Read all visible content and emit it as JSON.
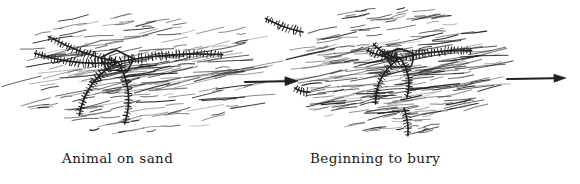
{
  "figure": {
    "medium": "pen-and-ink hand drawing",
    "background_color": "#ffffff",
    "ink_color": "#1f1f1f",
    "width": 580,
    "height": 184
  },
  "panels": [
    {
      "id": "panel-1",
      "caption": "Animal on sand",
      "caption_x": 62,
      "caption_y": 163,
      "subject": "brittle-star",
      "state": "fully exposed on sand surface",
      "center_x": 118,
      "center_y": 62,
      "disc": {
        "cx": 118,
        "cy": 62,
        "rx": 17,
        "ry": 11
      },
      "arms": [
        {
          "name": "arm-upper-left",
          "angle_deg": 186,
          "length": 84,
          "curve": -9,
          "spines": 26
        },
        {
          "name": "arm-mid-left",
          "angle_deg": 200,
          "length": 74,
          "curve": -6,
          "spines": 22
        },
        {
          "name": "arm-right",
          "angle_deg": 356,
          "length": 105,
          "curve": -7,
          "spines": 30
        },
        {
          "name": "arm-lower-left",
          "angle_deg": 126,
          "length": 66,
          "curve": 16,
          "spines": 20
        },
        {
          "name": "arm-lower-right",
          "angle_deg": 84,
          "length": 62,
          "curve": -14,
          "spines": 19
        }
      ],
      "sand_patch": {
        "x": 18,
        "y": 8,
        "w": 250,
        "h": 126,
        "stroke_count": 170
      }
    },
    {
      "id": "panel-2",
      "caption": "Beginning to bury",
      "caption_x": 310,
      "caption_y": 163,
      "subject": "brittle-star",
      "state": "partially covered by sand, arms fragmented",
      "center_x": 400,
      "center_y": 58,
      "disc": {
        "cx": 400,
        "cy": 58,
        "rx": 16,
        "ry": 10
      },
      "arms": [
        {
          "name": "arm-upper-left-fragment",
          "angle_deg": 208,
          "length": 30,
          "curve": -6,
          "spines": 10
        },
        {
          "name": "arm-left-fragment",
          "angle_deg": 193,
          "length": 34,
          "curve": -4,
          "spines": 11
        },
        {
          "name": "arm-right",
          "angle_deg": 354,
          "length": 72,
          "curve": -5,
          "spines": 22
        },
        {
          "name": "arm-lower-left",
          "angle_deg": 118,
          "length": 52,
          "curve": 14,
          "spines": 16
        },
        {
          "name": "arm-lower-right",
          "angle_deg": 80,
          "length": 40,
          "curve": -10,
          "spines": 13
        }
      ],
      "detached_fragments": [
        {
          "name": "fragment-far-left",
          "x": 303,
          "y": 32,
          "angle_deg": 200,
          "length": 40,
          "spines": 12
        },
        {
          "name": "fragment-low-left",
          "x": 310,
          "y": 92,
          "angle_deg": 195,
          "length": 16,
          "spines": 5
        },
        {
          "name": "fragment-low-right",
          "x": 404,
          "y": 108,
          "angle_deg": 82,
          "length": 28,
          "spines": 9
        }
      ],
      "sand_patch": {
        "x": 295,
        "y": 6,
        "w": 200,
        "h": 128,
        "stroke_count": 185
      }
    }
  ],
  "arrows": [
    {
      "name": "arrow-panel1-to-panel2",
      "x1": 245,
      "y1": 82,
      "x2": 298,
      "y2": 81,
      "head_length": 13,
      "head_width": 9,
      "stroke_width": 2.1
    },
    {
      "name": "arrow-panel2-to-next",
      "x1": 507,
      "y1": 79,
      "x2": 566,
      "y2": 78,
      "head_length": 12,
      "head_width": 8,
      "stroke_width": 1.9
    }
  ]
}
